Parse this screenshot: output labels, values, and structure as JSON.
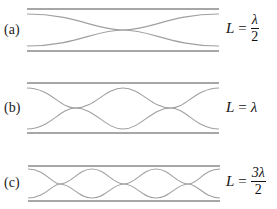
{
  "figure": {
    "colors": {
      "tube": "#8a8a8a",
      "wave": "#a0a0a0",
      "text": "#222222"
    },
    "panels": [
      {
        "id": "a",
        "label": "(a)",
        "equation": {
          "lhs": "L",
          "eq": "=",
          "numerator": "λ",
          "denominator": "2",
          "inline": null
        },
        "half_wavelengths": 1
      },
      {
        "id": "b",
        "label": "(b)",
        "equation": {
          "lhs": "L",
          "eq": "=",
          "numerator": null,
          "denominator": null,
          "inline": "λ"
        },
        "half_wavelengths": 2
      },
      {
        "id": "c",
        "label": "(c)",
        "equation": {
          "lhs": "L",
          "eq": "=",
          "numerator": "3λ",
          "denominator": "2",
          "inline": null
        },
        "half_wavelengths": 3
      }
    ]
  }
}
